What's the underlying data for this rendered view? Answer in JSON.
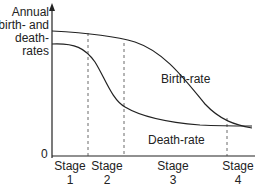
{
  "y_axis": {
    "label_lines": [
      "Annual",
      "birth- and",
      "death-",
      "rates"
    ],
    "origin_label": "0"
  },
  "series": {
    "birth_rate": "Birth-rate",
    "death_rate": "Death-rate"
  },
  "stages": [
    {
      "label": "Stage",
      "number": "1"
    },
    {
      "label": "Stage",
      "number": "2"
    },
    {
      "label": "Stage",
      "number": "3"
    },
    {
      "label": "Stage",
      "number": "4"
    }
  ],
  "colors": {
    "line": "#222222",
    "background": "#ffffff"
  }
}
